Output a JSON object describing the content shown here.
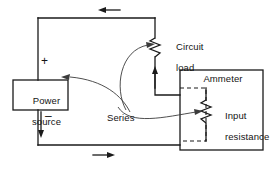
{
  "figure": {
    "type": "circuit-schematic"
  },
  "labels": {
    "power_source_line1": "Power",
    "power_source_line2": "source",
    "circuit_load_line1": "Circuit",
    "circuit_load_line2": "load",
    "ammeter": "Ammeter",
    "input_resistance_line1": "Input",
    "input_resistance_line2": "resistance",
    "series": "Series",
    "plus": "+",
    "minus": "–"
  },
  "components": [
    {
      "name": "power-source",
      "kind": "box",
      "label": "Power source"
    },
    {
      "name": "circuit-load",
      "kind": "resistor",
      "label": "Circuit load"
    },
    {
      "name": "ammeter",
      "kind": "box",
      "label": "Ammeter"
    },
    {
      "name": "input-resistance",
      "kind": "resistor",
      "label": "Input resistance"
    }
  ],
  "annotations": [
    {
      "name": "current-arrow-top",
      "direction": "left"
    },
    {
      "name": "current-arrow-bottom",
      "direction": "right"
    },
    {
      "name": "current-arrow-load",
      "direction": "up"
    },
    {
      "name": "polarity-positive",
      "symbol": "+"
    },
    {
      "name": "polarity-negative",
      "symbol": "–"
    }
  ],
  "colors": {
    "ink": "#1a1a1a",
    "leader": "#3b3b3b",
    "background": "#ffffff"
  }
}
